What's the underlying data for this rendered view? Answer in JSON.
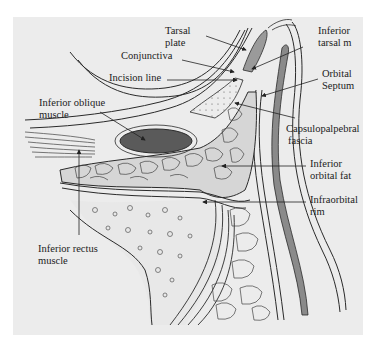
{
  "figure": {
    "background_color": "#ececec",
    "line_color": "#2a2a2a",
    "muscle_fill": "#555555",
    "septum_fill": "#8a8a8a",
    "fat_fill": "#d6d6d6"
  },
  "labels": {
    "tarsal_plate": {
      "line1": "Tarsal",
      "line2": "plate"
    },
    "inferior_tarsal_m": {
      "line1": "Inferior",
      "line2": "tarsal m"
    },
    "conjunctiva": "Conjunctiva",
    "incision_line": "Incision line",
    "orbital_septum": {
      "line1": "Orbital",
      "line2": "Septum"
    },
    "inferior_oblique_muscle": {
      "line1": "Inferior oblique",
      "line2": "muscle"
    },
    "capsulopalpebral_fascia": {
      "line1": "Capsulopalpebral",
      "line2": "fascia"
    },
    "inferior_orbital_fat": {
      "line1": "Inferior",
      "line2": "orbital fat"
    },
    "infraorbital_rim": {
      "line1": "Infraorbital",
      "line2": "rim"
    },
    "inferior_rectus_muscle": {
      "line1": "Inferior rectus",
      "line2": "muscle"
    }
  }
}
